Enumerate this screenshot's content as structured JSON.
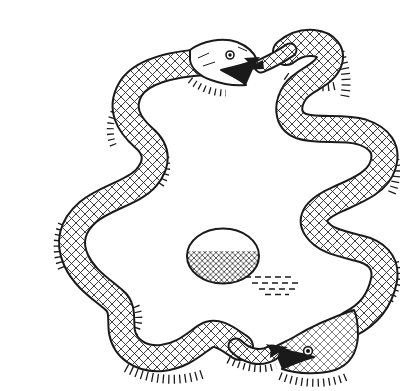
{
  "illustration": {
    "title": "Two snakes encircling an egg",
    "description": "Pen-and-ink line drawing of two crosshatched snakes, each biting the other's tail, forming a closed loop around a single egg. The egg sits at the center with hatched shading on its underside and a dashed cast shadow to its lower right. One snake's head is at the top with open jaws; the other snake's head is at the bottom right with open jaws.",
    "style": "pen-and-ink crosshatch drawing",
    "objects": {
      "top_snake": "snake head at top center with open mouth gripping the other snake's tail; body winds down the left side and along the bottom",
      "bottom_snake": "snake head at bottom right with open mouth gripping the other snake's tail; body winds up the right side to the top arc",
      "egg": "oval egg at center with crosshatched lower half and horizontal dashed shadow"
    },
    "colors": {
      "ink": "#1a1a1a",
      "paper": "#ffffff",
      "hatch": "#2a2a2a"
    }
  }
}
